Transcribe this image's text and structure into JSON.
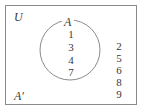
{
  "venn": {
    "universe_label": "U",
    "set_label": "A",
    "complement_label": "A′",
    "inside_set": [
      "1",
      "3",
      "4",
      "7"
    ],
    "outside_set": [
      "2",
      "5",
      "6",
      "8",
      "9"
    ],
    "colors": {
      "border": "#8a8a8a",
      "circle": "#8a8a8a",
      "text": "#3a3a3a"
    }
  }
}
